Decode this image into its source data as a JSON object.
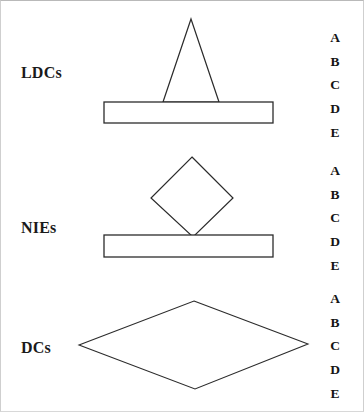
{
  "figure": {
    "width": 364,
    "height": 412,
    "background_color": "#ffffff",
    "stroke_color": "#2b2b2b",
    "text_color": "#141414"
  },
  "groups": [
    {
      "label": "LDCs",
      "shape": "triangle-on-bar",
      "letters": [
        "A",
        "B",
        "C",
        "D",
        "E"
      ]
    },
    {
      "label": "NIEs",
      "shape": "diamond-on-bar",
      "letters": [
        "A",
        "B",
        "C",
        "D",
        "E"
      ]
    },
    {
      "label": "DCs",
      "shape": "wide-diamond",
      "letters": [
        "A",
        "B",
        "C",
        "D",
        "E"
      ]
    }
  ]
}
